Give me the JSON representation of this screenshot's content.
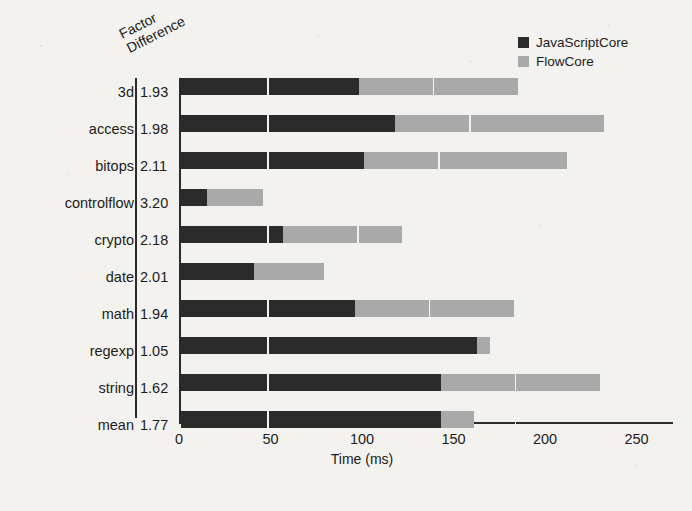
{
  "figure": {
    "background_color": "#f4f2ee",
    "series_colors": {
      "dark": "#2b2b2b",
      "light": "#a9a9a9"
    }
  },
  "factor_header": {
    "line1": "Factor",
    "line2": "Difference"
  },
  "legend": {
    "items": [
      {
        "label": "JavaScriptCore",
        "color": "#2b2b2b",
        "swatch_name": "legend-swatch-javascriptcore"
      },
      {
        "label": "FlowCore",
        "color": "#a9a9a9",
        "swatch_name": "legend-swatch-flowcore"
      }
    ]
  },
  "axis": {
    "x_title": "Time (ms)",
    "ticks": [
      "0",
      "50",
      "100",
      "150",
      "200",
      "250"
    ]
  },
  "chart_data": {
    "type": "bar",
    "orientation": "horizontal",
    "stacked": true,
    "title": "",
    "xlabel": "Time (ms)",
    "ylabel": "",
    "xlim": [
      0,
      250
    ],
    "grid": false,
    "legend_position": "top-right",
    "categories": [
      "3d",
      "access",
      "bitops",
      "controlflow",
      "crypto",
      "date",
      "math",
      "regexp",
      "string",
      "mean"
    ],
    "series": [
      {
        "name": "JavaScriptCore",
        "color": "#2b2b2b",
        "values": [
          97,
          117,
          100,
          14,
          56,
          40,
          95,
          162,
          142,
          142
        ]
      },
      {
        "name": "FlowCore",
        "color": "#a9a9a9",
        "values": [
          87,
          114,
          111,
          31,
          65,
          38,
          87,
          7,
          87,
          18
        ]
      }
    ],
    "totals": [
      184,
      231,
      211,
      45,
      121,
      78,
      182,
      169,
      229,
      160
    ],
    "annotations": {
      "column_header": "Factor Difference",
      "factor_difference": [
        "1.93",
        "1.98",
        "2.11",
        "3.20",
        "2.18",
        "2.01",
        "1.94",
        "1.05",
        "1.62",
        "1.77"
      ]
    }
  },
  "rows": [
    {
      "label": "3d",
      "factor": "1.93",
      "dark": 97,
      "light": 87,
      "y": 14
    },
    {
      "label": "access",
      "factor": "1.98",
      "dark": 117,
      "light": 114,
      "y": 51
    },
    {
      "label": "bitops",
      "factor": "2.11",
      "dark": 100,
      "light": 111,
      "y": 88
    },
    {
      "label": "controlflow",
      "factor": "3.20",
      "dark": 14,
      "light": 31,
      "y": 125
    },
    {
      "label": "crypto",
      "factor": "2.18",
      "dark": 56,
      "light": 65,
      "y": 162
    },
    {
      "label": "date",
      "factor": "2.01",
      "dark": 40,
      "light": 38,
      "y": 199
    },
    {
      "label": "math",
      "factor": "1.94",
      "dark": 95,
      "light": 87,
      "y": 236
    },
    {
      "label": "regexp",
      "factor": "1.05",
      "dark": 162,
      "light": 7,
      "y": 273
    },
    {
      "label": "string",
      "factor": "1.62",
      "dark": 142,
      "light": 87,
      "y": 310
    },
    {
      "label": "mean",
      "factor": "1.77",
      "dark": 142,
      "light": 18,
      "y": 347
    }
  ]
}
